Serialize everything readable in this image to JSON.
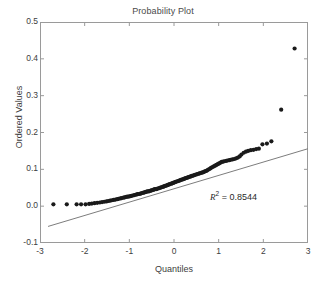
{
  "figure": {
    "title": "Probability Plot",
    "background_color": "#ffffff",
    "axis_color": "#9a9a9a",
    "point_color": "#1a1a1a",
    "line_color": "#7d7d7d",
    "text_color": "#3d3d3d"
  },
  "annotation": {
    "r_symbol": "R",
    "exponent": "2",
    "equals": " = ",
    "r_squared_value": "0.8544",
    "full_text": "R2 = 0.8544"
  },
  "chart_data": {
    "type": "scatter",
    "title": "Probability Plot",
    "xlabel": "Quantiles",
    "ylabel": "Ordered Values",
    "xlim": [
      -3,
      3
    ],
    "ylim": [
      -0.1,
      0.5
    ],
    "xticks": [
      -3,
      -2,
      -1,
      0,
      1,
      2,
      3
    ],
    "xtick_labels": [
      "-3",
      "-2",
      "-1",
      "0",
      "1",
      "2",
      "3"
    ],
    "yticks": [
      -0.1,
      0.0,
      0.1,
      0.2,
      0.3,
      0.4,
      0.5
    ],
    "ytick_labels": [
      "-0.1",
      "0.0",
      "0.1",
      "0.2",
      "0.3",
      "0.4",
      "0.5"
    ],
    "grid": false,
    "legend": "none",
    "series": [
      {
        "name": "Ordered Values",
        "type": "scatter",
        "marker": "filled-circle",
        "x": [
          -2.7,
          -2.4,
          -2.18,
          -2.08,
          -1.98,
          -1.9,
          -1.84,
          -1.78,
          -1.72,
          -1.66,
          -1.61,
          -1.56,
          -1.51,
          -1.47,
          -1.43,
          -1.39,
          -1.35,
          -1.31,
          -1.27,
          -1.24,
          -1.2,
          -1.17,
          -1.13,
          -1.1,
          -1.07,
          -1.04,
          -1.01,
          -0.98,
          -0.95,
          -0.92,
          -0.89,
          -0.86,
          -0.83,
          -0.81,
          -0.78,
          -0.75,
          -0.73,
          -0.7,
          -0.67,
          -0.65,
          -0.62,
          -0.6,
          -0.57,
          -0.55,
          -0.52,
          -0.5,
          -0.47,
          -0.45,
          -0.43,
          -0.4,
          -0.38,
          -0.36,
          -0.33,
          -0.31,
          -0.29,
          -0.26,
          -0.24,
          -0.22,
          -0.2,
          -0.17,
          -0.15,
          -0.13,
          -0.11,
          -0.09,
          -0.06,
          -0.04,
          -0.02,
          0.0,
          0.02,
          0.04,
          0.06,
          0.09,
          0.11,
          0.13,
          0.15,
          0.17,
          0.2,
          0.22,
          0.24,
          0.26,
          0.29,
          0.31,
          0.33,
          0.36,
          0.38,
          0.4,
          0.43,
          0.45,
          0.47,
          0.5,
          0.52,
          0.55,
          0.57,
          0.6,
          0.62,
          0.65,
          0.67,
          0.7,
          0.73,
          0.75,
          0.78,
          0.81,
          0.83,
          0.86,
          0.89,
          0.92,
          0.95,
          0.98,
          1.01,
          1.04,
          1.07,
          1.1,
          1.13,
          1.17,
          1.2,
          1.24,
          1.27,
          1.31,
          1.35,
          1.39,
          1.43,
          1.47,
          1.51,
          1.56,
          1.61,
          1.66,
          1.72,
          1.78,
          1.84,
          1.9,
          1.98,
          2.08,
          2.18,
          2.4,
          2.7
        ],
        "y": [
          0.005,
          0.005,
          0.005,
          0.005,
          0.005,
          0.006,
          0.007,
          0.008,
          0.009,
          0.01,
          0.011,
          0.012,
          0.013,
          0.014,
          0.015,
          0.016,
          0.017,
          0.018,
          0.019,
          0.02,
          0.021,
          0.022,
          0.023,
          0.024,
          0.025,
          0.026,
          0.026,
          0.027,
          0.028,
          0.029,
          0.03,
          0.031,
          0.032,
          0.033,
          0.033,
          0.034,
          0.035,
          0.036,
          0.037,
          0.038,
          0.039,
          0.04,
          0.04,
          0.041,
          0.042,
          0.043,
          0.044,
          0.045,
          0.046,
          0.046,
          0.047,
          0.048,
          0.049,
          0.05,
          0.051,
          0.052,
          0.053,
          0.054,
          0.055,
          0.056,
          0.057,
          0.058,
          0.059,
          0.06,
          0.061,
          0.062,
          0.063,
          0.064,
          0.065,
          0.066,
          0.067,
          0.068,
          0.069,
          0.07,
          0.071,
          0.072,
          0.073,
          0.074,
          0.075,
          0.076,
          0.077,
          0.078,
          0.079,
          0.08,
          0.081,
          0.082,
          0.083,
          0.084,
          0.085,
          0.086,
          0.087,
          0.088,
          0.089,
          0.09,
          0.091,
          0.092,
          0.093,
          0.095,
          0.096,
          0.098,
          0.1,
          0.102,
          0.104,
          0.106,
          0.108,
          0.11,
          0.112,
          0.114,
          0.116,
          0.118,
          0.12,
          0.121,
          0.122,
          0.123,
          0.124,
          0.125,
          0.126,
          0.127,
          0.128,
          0.13,
          0.132,
          0.135,
          0.14,
          0.145,
          0.148,
          0.15,
          0.152,
          0.153,
          0.155,
          0.156,
          0.168,
          0.17,
          0.176,
          0.262,
          0.428
        ]
      },
      {
        "name": "Reference Line",
        "type": "line",
        "x": [
          -2.82,
          3.0
        ],
        "y": [
          -0.055,
          0.156
        ]
      }
    ]
  }
}
